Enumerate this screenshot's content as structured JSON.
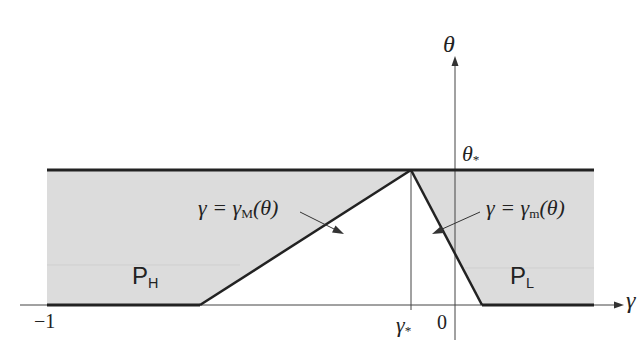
{
  "diagram": {
    "type": "phase-diagram",
    "axes": {
      "x_label": "γ",
      "y_label": "θ",
      "x_tick_min": "−1",
      "x_tick_zero": "0",
      "x_tick_star": "γ",
      "x_tick_star_sub": "*",
      "y_tick_star": "θ",
      "y_tick_star_sub": "*"
    },
    "regions": [
      {
        "name": "P",
        "sub": "H"
      },
      {
        "name": "P",
        "sub": "L"
      }
    ],
    "curves": [
      {
        "lhs": "γ = γ",
        "sub": "M",
        "rhs": "(θ)"
      },
      {
        "lhs": "γ = γ",
        "sub": "m",
        "rhs": "(θ)"
      }
    ],
    "colors": {
      "fill": "#dcdcdc",
      "line": "#222222",
      "axis": "#444444"
    }
  }
}
